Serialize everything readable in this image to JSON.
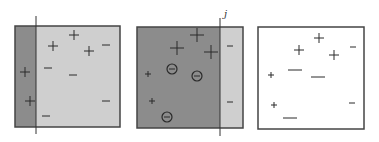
{
  "colors": {
    "dark_region": "#8c8c8c",
    "light_region": "#cfcfcf",
    "white_region": "#ffffff",
    "border": "#444444",
    "marker": "#2a2a2a"
  },
  "panels": [
    {
      "id": "panel-1",
      "box": [
        15,
        26,
        105,
        101
      ],
      "split_x": 36,
      "left_fill": "dark_region",
      "right_fill": "light_region",
      "line": {
        "x": 36,
        "y1": 16,
        "y2": 134
      },
      "label": "",
      "markers": [
        {
          "type": "plus",
          "x": 74,
          "y": 35,
          "size": 5
        },
        {
          "type": "plus",
          "x": 53,
          "y": 46,
          "size": 5
        },
        {
          "type": "plus",
          "x": 89,
          "y": 51,
          "size": 5
        },
        {
          "type": "plus",
          "x": 25,
          "y": 72,
          "size": 5
        },
        {
          "type": "plus",
          "x": 30,
          "y": 101,
          "size": 5
        },
        {
          "type": "minus",
          "x": 106,
          "y": 45,
          "size": 4
        },
        {
          "type": "minus",
          "x": 48,
          "y": 68,
          "size": 4
        },
        {
          "type": "minus",
          "x": 73,
          "y": 75,
          "size": 4
        },
        {
          "type": "minus",
          "x": 106,
          "y": 101,
          "size": 4
        },
        {
          "type": "minus",
          "x": 46,
          "y": 116,
          "size": 4
        }
      ]
    },
    {
      "id": "panel-2",
      "box": [
        137,
        27,
        106,
        101
      ],
      "split_x": 220,
      "left_fill": "dark_region",
      "right_fill": "light_region",
      "line": {
        "x": 220,
        "y1": 18,
        "y2": 136
      },
      "label": "j",
      "label_pos": [
        224,
        17
      ],
      "markers": [
        {
          "type": "plus",
          "x": 197,
          "y": 35,
          "size": 7
        },
        {
          "type": "plus",
          "x": 177,
          "y": 48,
          "size": 7
        },
        {
          "type": "plus",
          "x": 211,
          "y": 52,
          "size": 7
        },
        {
          "type": "plus",
          "x": 148,
          "y": 74,
          "size": 3
        },
        {
          "type": "plus",
          "x": 152,
          "y": 101,
          "size": 3
        },
        {
          "type": "circled-minus",
          "x": 172,
          "y": 69,
          "size": 5
        },
        {
          "type": "circled-minus",
          "x": 197,
          "y": 76,
          "size": 5
        },
        {
          "type": "circled-minus",
          "x": 167,
          "y": 117,
          "size": 5
        },
        {
          "type": "minus",
          "x": 230,
          "y": 46,
          "size": 3
        },
        {
          "type": "minus",
          "x": 230,
          "y": 102,
          "size": 3
        }
      ]
    },
    {
      "id": "panel-3",
      "box": [
        258,
        27,
        106,
        102
      ],
      "split_x": null,
      "left_fill": "white_region",
      "right_fill": "white_region",
      "line": null,
      "label": "",
      "markers": [
        {
          "type": "plus",
          "x": 319,
          "y": 38,
          "size": 5
        },
        {
          "type": "plus",
          "x": 299,
          "y": 50,
          "size": 5
        },
        {
          "type": "plus",
          "x": 334,
          "y": 55,
          "size": 5
        },
        {
          "type": "plus",
          "x": 271,
          "y": 75,
          "size": 3
        },
        {
          "type": "plus",
          "x": 274,
          "y": 105,
          "size": 3
        },
        {
          "type": "minus",
          "x": 295,
          "y": 70,
          "size": 7
        },
        {
          "type": "minus",
          "x": 318,
          "y": 77,
          "size": 7
        },
        {
          "type": "minus",
          "x": 290,
          "y": 118,
          "size": 7
        },
        {
          "type": "minus",
          "x": 353,
          "y": 47,
          "size": 3
        },
        {
          "type": "minus",
          "x": 352,
          "y": 103,
          "size": 3
        }
      ]
    }
  ]
}
